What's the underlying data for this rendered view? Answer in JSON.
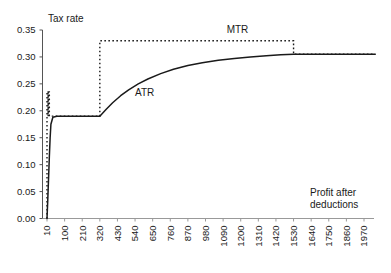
{
  "chart_data": {
    "type": "line",
    "title": "",
    "ylabel": "Tax rate",
    "xlabel": "Profit after deductions",
    "xlabel_line1": "Profit after",
    "xlabel_line2": "deductions",
    "ylim": [
      0.0,
      0.35
    ],
    "yticks": [
      0.0,
      0.05,
      0.1,
      0.15,
      0.2,
      0.25,
      0.3,
      0.35
    ],
    "ytick_labels": [
      "0.00",
      "0.05",
      "0.10",
      "0.15",
      "0.20",
      "0.25",
      "0.30",
      "0.35"
    ],
    "categories": [
      10,
      100,
      210,
      320,
      430,
      540,
      650,
      760,
      870,
      980,
      1090,
      1200,
      1310,
      1420,
      1530,
      1640,
      1750,
      1860,
      1970
    ],
    "xtick_labels": [
      "10",
      "100",
      "210",
      "320",
      "430",
      "540",
      "650",
      "760",
      "870",
      "980",
      "1090",
      "1200",
      "1310",
      "1420",
      "1530",
      "1640",
      "1750",
      "1860",
      "1970"
    ],
    "grid": false,
    "legend_position": "inline-annotations",
    "series": [
      {
        "name": "ATR",
        "style": "solid",
        "color": "#1a1a1a",
        "annotation": "ATR",
        "annotation_x": 600,
        "annotation_y": 0.228,
        "x": [
          10,
          14,
          18,
          22,
          26,
          30,
          40,
          60,
          100,
          150,
          210,
          270,
          320,
          360,
          400,
          450,
          500,
          560,
          620,
          700,
          780,
          870,
          960,
          1060,
          1160,
          1260,
          1360,
          1450,
          1530,
          1640,
          1750,
          1860,
          1970,
          2040
        ],
        "values": [
          0.0,
          0.035,
          0.075,
          0.115,
          0.15,
          0.175,
          0.188,
          0.19,
          0.19,
          0.19,
          0.19,
          0.19,
          0.19,
          0.203,
          0.215,
          0.228,
          0.239,
          0.25,
          0.259,
          0.269,
          0.277,
          0.284,
          0.289,
          0.294,
          0.297,
          0.3,
          0.302,
          0.304,
          0.305,
          0.305,
          0.305,
          0.305,
          0.305,
          0.305
        ]
      },
      {
        "name": "MTR",
        "style": "dotted",
        "color": "#1a1a1a",
        "annotation": "MTR",
        "annotation_x": 1180,
        "annotation_y": 0.345,
        "x": [
          10,
          10,
          16,
          16,
          16,
          22,
          22,
          320,
          320,
          1530,
          1530,
          1640,
          1750,
          1860,
          1970,
          2040
        ],
        "values": [
          0.0,
          0.235,
          0.235,
          0.19,
          0.235,
          0.235,
          0.19,
          0.19,
          0.33,
          0.33,
          0.305,
          0.305,
          0.305,
          0.305,
          0.305,
          0.305
        ]
      }
    ],
    "notes": {
      "atr_plateau": 0.19,
      "atr_asymptote": 0.305,
      "mtr_high": 0.33,
      "mtr_initial_spike": 0.235,
      "kink_x": 320,
      "merge_x": 1530
    }
  }
}
